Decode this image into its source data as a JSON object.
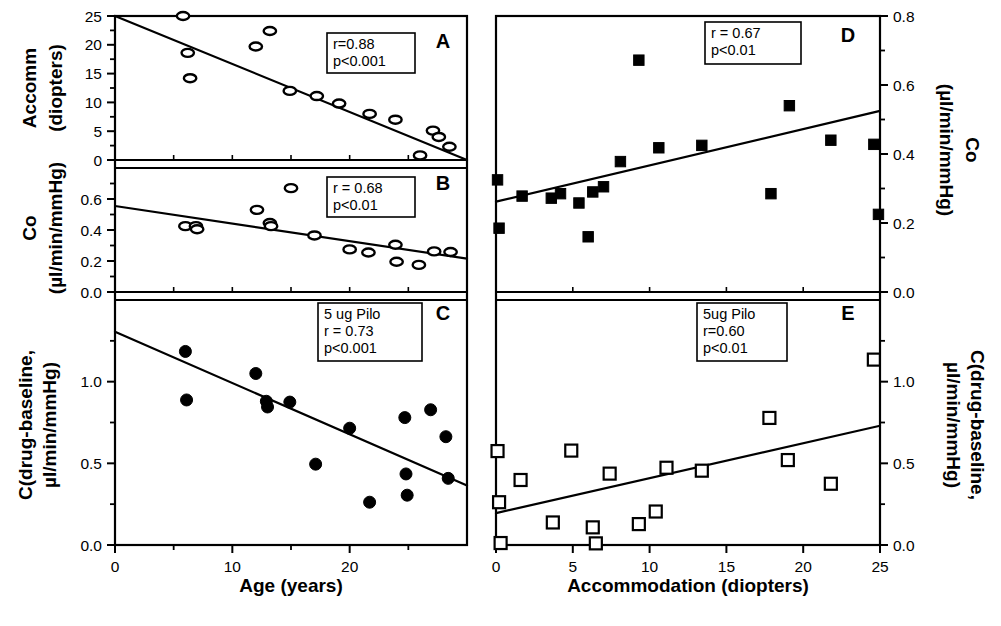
{
  "figure": {
    "title": "",
    "panel_count": 5,
    "background": "#ffffff",
    "ink": "#000000"
  },
  "axes_titles": {
    "bottom_left": "Age (years)",
    "bottom_right": "Accommodation (diopters)",
    "left_a_line1": "Accomm",
    "left_a_line2": "(diopters)",
    "left_b_line1": "Co",
    "left_b_line2": "(µl/min/mmHg)",
    "left_c_line1": "C(drug-baseline,",
    "left_c_line2": "µl/min/mmHg)",
    "right_d_line1": "Co",
    "right_d_line2": "(µl/min/mmHg)",
    "right_e_line1": "C(drug-baseline,",
    "right_e_line2": "µl/min/mmHg)"
  },
  "chart_data": [
    {
      "id": "A",
      "panel_letter": "A",
      "type": "scatter",
      "marker": "open-ellipse",
      "title": "",
      "xlabel": "Age (years)",
      "ylabel": "Accomm (diopters)",
      "xlim": [
        0,
        30
      ],
      "ylim": [
        0,
        25
      ],
      "xticks": [
        0,
        10,
        20
      ],
      "xticklabels": [
        "0",
        "10",
        "20"
      ],
      "xminorticks": [
        5,
        15,
        25
      ],
      "yticks": [
        0,
        5,
        10,
        15,
        20,
        25
      ],
      "yticklabels": [
        "0",
        "5",
        "10",
        "15",
        "20",
        "25"
      ],
      "grid": false,
      "annotations": {
        "r": "r=0.88",
        "p": "p<0.001"
      },
      "fit": {
        "x0": 0,
        "y0": 25.0,
        "x1": 30,
        "y1": 0.0
      },
      "x": [
        5.8,
        6.2,
        6.4,
        12.0,
        13.2,
        14.9,
        17.2,
        19.1,
        21.7,
        23.9,
        26.0,
        27.1,
        27.6,
        28.5
      ],
      "y": [
        25.0,
        18.6,
        14.2,
        19.7,
        22.4,
        12.0,
        11.1,
        9.8,
        8.0,
        7.0,
        0.8,
        5.1,
        4.0,
        2.3
      ]
    },
    {
      "id": "B",
      "panel_letter": "B",
      "type": "scatter",
      "marker": "open-ellipse",
      "title": "",
      "xlabel": "Age (years)",
      "ylabel": "Co (µl/min/mmHg)",
      "xlim": [
        0,
        30
      ],
      "ylim": [
        0.0,
        0.8
      ],
      "xticks": [
        0,
        10,
        20
      ],
      "xticklabels": [
        "0",
        "10",
        "20"
      ],
      "xminorticks": [
        5,
        15,
        25
      ],
      "yticks": [
        0.0,
        0.2,
        0.4,
        0.6
      ],
      "yticklabels": [
        "0.0",
        "0.2",
        "0.4",
        "0.6"
      ],
      "grid": false,
      "annotations": {
        "r": "r = 0.68",
        "p": "p<0.01"
      },
      "fit": {
        "x0": 0,
        "y0": 0.555,
        "x1": 30,
        "y1": 0.215
      },
      "x": [
        6.0,
        6.9,
        7.0,
        12.1,
        13.2,
        13.3,
        15.0,
        17.0,
        20.0,
        21.6,
        23.9,
        24.0,
        25.9,
        27.2,
        28.6
      ],
      "y": [
        0.425,
        0.425,
        0.405,
        0.53,
        0.445,
        0.425,
        0.67,
        0.365,
        0.275,
        0.255,
        0.305,
        0.195,
        0.175,
        0.262,
        0.258
      ]
    },
    {
      "id": "C",
      "panel_letter": "C",
      "type": "scatter",
      "marker": "filled-circle",
      "title": "",
      "xlabel": "Age (years)",
      "ylabel": "C(drug-baseline, µl/min/mmHg)",
      "xlim": [
        0,
        30
      ],
      "ylim": [
        0.0,
        1.5
      ],
      "xticks": [
        0,
        10,
        20
      ],
      "xticklabels": [
        "0",
        "10",
        "20"
      ],
      "xminorticks": [
        5,
        15,
        25
      ],
      "yticks": [
        0.0,
        0.5,
        1.0
      ],
      "yticklabels": [
        "0.0",
        "0.5",
        "1.0"
      ],
      "yminorticks": [
        0.25,
        0.75,
        1.25
      ],
      "grid": false,
      "annotations": {
        "dose": "5 ug Pilo",
        "r": "r = 0.73",
        "p": "p<0.001"
      },
      "fit": {
        "x0": 0,
        "y0": 1.305,
        "x1": 30,
        "y1": 0.365
      },
      "x": [
        6.0,
        6.1,
        12.0,
        12.9,
        13.0,
        14.9,
        17.1,
        20.0,
        21.7,
        24.7,
        24.8,
        24.9,
        26.9,
        28.2,
        28.4
      ],
      "y": [
        1.185,
        0.888,
        1.05,
        0.88,
        0.845,
        0.875,
        0.495,
        0.715,
        0.262,
        0.78,
        0.435,
        0.305,
        0.828,
        0.663,
        0.408
      ]
    },
    {
      "id": "D",
      "panel_letter": "D",
      "type": "scatter",
      "marker": "filled-square",
      "title": "",
      "xlabel": "Accommodation (diopters)",
      "ylabel": "Co (µl/min/mmHg)",
      "xlim": [
        0,
        25
      ],
      "ylim": [
        0.0,
        0.8
      ],
      "xticks": [
        0,
        5,
        10,
        15,
        20,
        25
      ],
      "xticklabels": [
        "0",
        "5",
        "10",
        "15",
        "20",
        "25"
      ],
      "yticks": [
        0.0,
        0.2,
        0.4,
        0.6,
        0.8
      ],
      "yticklabels": [
        "0.0",
        "0.2",
        "0.4",
        "0.6",
        "0.8"
      ],
      "yminorticks": [
        0.1,
        0.3,
        0.5,
        0.7
      ],
      "grid": false,
      "annotations": {
        "r": "r = 0.67",
        "p": "p<0.01"
      },
      "fit": {
        "x0": 0,
        "y0": 0.262,
        "x1": 25,
        "y1": 0.525
      },
      "x": [
        0.1,
        0.2,
        1.7,
        3.6,
        4.2,
        5.4,
        6.0,
        6.3,
        7.0,
        8.1,
        9.3,
        10.6,
        13.4,
        17.9,
        19.1,
        21.8,
        24.6,
        24.9
      ],
      "y": [
        0.325,
        0.185,
        0.278,
        0.272,
        0.285,
        0.258,
        0.16,
        0.29,
        0.305,
        0.378,
        0.672,
        0.418,
        0.425,
        0.285,
        0.54,
        0.44,
        0.428,
        0.225
      ]
    },
    {
      "id": "E",
      "panel_letter": "E",
      "type": "scatter",
      "marker": "open-square",
      "title": "",
      "xlabel": "Accommodation (diopters)",
      "ylabel": "C(drug-baseline, µl/min/mmHg)",
      "xlim": [
        0,
        25
      ],
      "ylim": [
        0.0,
        1.5
      ],
      "xticks": [
        0,
        5,
        10,
        15,
        20,
        25
      ],
      "xticklabels": [
        "0",
        "5",
        "10",
        "15",
        "20",
        "25"
      ],
      "yticks": [
        0.0,
        0.5,
        1.0
      ],
      "yticklabels": [
        "0.0",
        "0.5",
        "1.0"
      ],
      "yminorticks": [
        0.25,
        0.75,
        1.25
      ],
      "grid": false,
      "annotations": {
        "dose": "5ug Pilo",
        "r": "r=0.60",
        "p": "p<0.01"
      },
      "fit": {
        "x0": 0,
        "y0": 0.195,
        "x1": 25,
        "y1": 0.73
      },
      "x": [
        0.1,
        0.2,
        0.3,
        1.6,
        3.7,
        4.9,
        6.3,
        6.5,
        7.4,
        9.3,
        10.4,
        11.1,
        13.4,
        17.8,
        19.0,
        21.8,
        24.6
      ],
      "y": [
        0.575,
        0.262,
        0.012,
        0.398,
        0.138,
        0.578,
        0.108,
        0.01,
        0.437,
        0.128,
        0.205,
        0.473,
        0.455,
        0.778,
        0.52,
        0.375,
        1.135
      ]
    }
  ]
}
